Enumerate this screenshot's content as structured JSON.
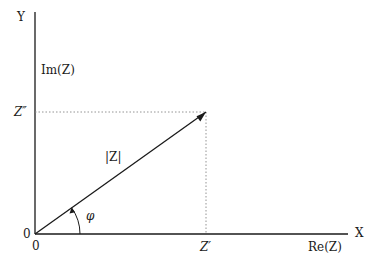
{
  "diagram": {
    "axes": {
      "y_axis_label": "Y",
      "x_axis_label": "X",
      "imag_label": "Im(Z)",
      "real_label": "Re(Z)",
      "origin_y_label": "0",
      "origin_x_label": "0"
    },
    "projections": {
      "imag_component_label": "Z″",
      "real_component_label": "Z′"
    },
    "vector": {
      "magnitude_label": "|Z|",
      "angle_label": "φ"
    },
    "colors": {
      "line": "#1a1a1a",
      "dotted_guide": "#888888",
      "background": "#ffffff"
    },
    "geometry": {
      "origin": [
        35,
        234
      ],
      "y_axis_top": [
        35,
        12
      ],
      "x_axis_end": [
        348,
        234
      ],
      "vector_tip": [
        206,
        112
      ]
    }
  }
}
